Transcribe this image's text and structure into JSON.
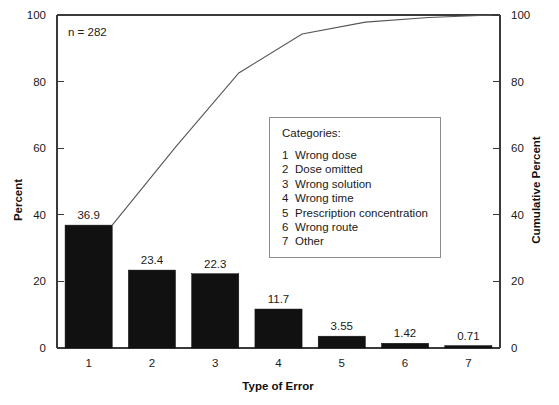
{
  "chart_data": {
    "type": "bar",
    "title": "",
    "subtitle": "",
    "xlabel": "Type of Error",
    "ylabel": "Percent",
    "y2label": "Cumulative Percent",
    "categories": [
      "1",
      "2",
      "3",
      "4",
      "5",
      "6",
      "7"
    ],
    "values": [
      36.9,
      23.4,
      22.3,
      11.7,
      3.55,
      1.42,
      0.71
    ],
    "value_labels": [
      "36.9",
      "23.4",
      "22.3",
      "11.7",
      "3.55",
      "1.42",
      "0.71"
    ],
    "series": [
      {
        "name": "Percent",
        "type": "bar",
        "values": [
          36.9,
          23.4,
          22.3,
          11.7,
          3.55,
          1.42,
          0.71
        ]
      },
      {
        "name": "Cumulative Percent",
        "type": "line",
        "values": [
          36.9,
          60.3,
          82.6,
          94.3,
          97.85,
          99.27,
          99.98
        ]
      }
    ],
    "ylim": [
      0,
      100
    ],
    "y2lim": [
      0,
      100
    ],
    "yticks": [
      0,
      20,
      40,
      60,
      80,
      100
    ],
    "ytick_labels": [
      "0",
      "20",
      "40",
      "60",
      "80",
      "100"
    ],
    "y2ticks": [
      0,
      20,
      40,
      60,
      80,
      100
    ],
    "y2tick_labels": [
      "0",
      "20",
      "40",
      "60",
      "80",
      "100"
    ],
    "xtick_labels": [
      "1",
      "2",
      "3",
      "4",
      "5",
      "6",
      "7"
    ],
    "grid": false,
    "legend_position": "inside-center-right",
    "bar_color": "#111111",
    "line_color": "#555555",
    "axis_color": "#3a3a3a",
    "annotations": [
      {
        "text": "n = 282",
        "x": 1,
        "y": 95
      }
    ]
  },
  "annotation": {
    "sample_size": "n = 282"
  },
  "axes": {
    "left_title": "Percent",
    "right_title": "Cumulative Percent",
    "bottom_title": "Type of Error"
  },
  "legend": {
    "title": "Categories:",
    "items": [
      {
        "key": "1",
        "label": "Wrong dose"
      },
      {
        "key": "2",
        "label": "Dose omitted"
      },
      {
        "key": "3",
        "label": "Wrong solution"
      },
      {
        "key": "4",
        "label": "Wrong time"
      },
      {
        "key": "5",
        "label": "Prescription concentration"
      },
      {
        "key": "6",
        "label": "Wrong route"
      },
      {
        "key": "7",
        "label": "Other"
      }
    ]
  }
}
